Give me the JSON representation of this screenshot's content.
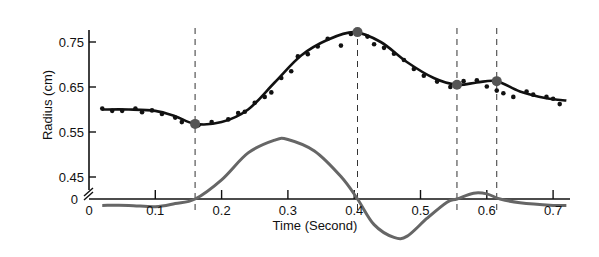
{
  "chart_data": {
    "type": "line",
    "title": "",
    "xlabel": "Time (Second)",
    "ylabel": "Radius (cm)",
    "xlim": [
      0,
      0.72
    ],
    "ylim": [
      0.45,
      0.77
    ],
    "x_ticks": [
      "0",
      "0.1",
      "0.2",
      "0.3",
      "0.4",
      "0.5",
      "0.6",
      "0.7"
    ],
    "y_ticks": [
      "0.75",
      "0.65",
      "0.55",
      "0.45"
    ],
    "y_break_label": "0",
    "grid": false,
    "legend": null,
    "series": [
      {
        "name": "Radius fitted curve",
        "color": "#111111",
        "x": [
          0.02,
          0.06,
          0.1,
          0.13,
          0.16,
          0.2,
          0.24,
          0.28,
          0.32,
          0.36,
          0.4,
          0.44,
          0.48,
          0.52,
          0.555,
          0.585,
          0.615,
          0.65,
          0.69,
          0.72
        ],
        "y": [
          0.6,
          0.6,
          0.597,
          0.585,
          0.568,
          0.572,
          0.6,
          0.66,
          0.72,
          0.755,
          0.772,
          0.75,
          0.705,
          0.67,
          0.655,
          0.66,
          0.663,
          0.64,
          0.625,
          0.62
        ]
      },
      {
        "name": "Radius measured points",
        "color": "#111111",
        "type": "scatter",
        "x": [
          0.02,
          0.035,
          0.05,
          0.07,
          0.08,
          0.095,
          0.11,
          0.13,
          0.14,
          0.165,
          0.185,
          0.21,
          0.225,
          0.235,
          0.25,
          0.265,
          0.275,
          0.29,
          0.305,
          0.315,
          0.33,
          0.345,
          0.36,
          0.38,
          0.395,
          0.42,
          0.43,
          0.445,
          0.46,
          0.475,
          0.49,
          0.505,
          0.525,
          0.545,
          0.565,
          0.585,
          0.6,
          0.615,
          0.625,
          0.64,
          0.66,
          0.67,
          0.69,
          0.7,
          0.71
        ],
        "y": [
          0.602,
          0.597,
          0.597,
          0.602,
          0.594,
          0.598,
          0.59,
          0.582,
          0.572,
          0.565,
          0.572,
          0.578,
          0.592,
          0.595,
          0.615,
          0.628,
          0.638,
          0.67,
          0.685,
          0.718,
          0.723,
          0.74,
          0.757,
          0.742,
          0.768,
          0.762,
          0.745,
          0.737,
          0.724,
          0.71,
          0.69,
          0.675,
          0.662,
          0.65,
          0.663,
          0.665,
          0.651,
          0.642,
          0.636,
          0.628,
          0.64,
          0.633,
          0.628,
          0.624,
          0.612
        ]
      },
      {
        "name": "Velocity (unscaled derivative)",
        "color": "#666666",
        "x": [
          0.02,
          0.06,
          0.1,
          0.13,
          0.16,
          0.2,
          0.24,
          0.28,
          0.3,
          0.34,
          0.38,
          0.405,
          0.43,
          0.46,
          0.48,
          0.51,
          0.54,
          0.555,
          0.58,
          0.6,
          0.62,
          0.65,
          0.7,
          0.72
        ],
        "y_relative": [
          -0.1,
          -0.1,
          -0.12,
          -0.07,
          0.0,
          0.3,
          0.72,
          0.92,
          0.93,
          0.75,
          0.35,
          0.0,
          -0.4,
          -0.6,
          -0.58,
          -0.3,
          -0.05,
          0.0,
          0.09,
          0.08,
          0.0,
          -0.06,
          -0.1,
          -0.1
        ]
      }
    ],
    "highlighted_points": [
      {
        "x": 0.16,
        "y": 0.568
      },
      {
        "x": 0.405,
        "y": 0.772
      },
      {
        "x": 0.555,
        "y": 0.655
      },
      {
        "x": 0.615,
        "y": 0.663
      }
    ],
    "vertical_dashed_lines_x": [
      0.16,
      0.405,
      0.555,
      0.615
    ]
  }
}
